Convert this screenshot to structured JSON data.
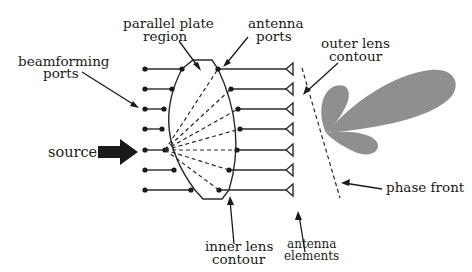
{
  "diagram": {
    "labels": {
      "parallel_plate": [
        "parallel plate",
        "region"
      ],
      "antenna_ports": [
        "antenna",
        "ports"
      ],
      "outer_lens": [
        "outer lens",
        "contour"
      ],
      "beamforming_ports": [
        "beamforming",
        "ports"
      ],
      "source": "source",
      "phase_front": "phase front",
      "inner_lens": [
        "inner lens",
        "contour"
      ],
      "antenna_elements": [
        "antenna",
        "elements"
      ]
    },
    "beamforming_port_count": 7,
    "antenna_port_count": 7,
    "antenna_element_count": 7,
    "source_port_index": 4,
    "colors": {
      "ink": "#1a1a1a",
      "radiation_pattern": "#8f8f8f"
    }
  }
}
